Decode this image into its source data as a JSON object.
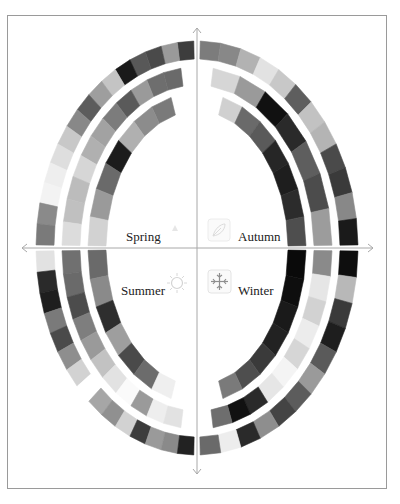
{
  "diagram": {
    "type": "seasonal-color-wheel",
    "center": {
      "x": 197,
      "y": 248
    },
    "axes": {
      "horizontal": {
        "x1": 22,
        "x2": 373,
        "y": 248,
        "arrows": "both"
      },
      "vertical": {
        "x": 197,
        "y1": 28,
        "y2": 474,
        "arrows": "both"
      }
    },
    "quadrants": [
      {
        "id": "spring",
        "label": "Spring",
        "icon": "flower-icon",
        "position": "top-left"
      },
      {
        "id": "autumn",
        "label": "Autumn",
        "icon": "leaf-icon",
        "position": "top-right"
      },
      {
        "id": "summer",
        "label": "Summer",
        "icon": "sun-icon",
        "position": "bottom-left"
      },
      {
        "id": "winter",
        "label": "Winter",
        "icon": "snowflake-icon",
        "position": "bottom-right"
      }
    ],
    "rings": [
      {
        "name": "outer",
        "rx": 152,
        "ry": 198,
        "width": 18
      },
      {
        "name": "middle",
        "rx": 126,
        "ry": 172,
        "width": 18
      },
      {
        "name": "inner",
        "rx": 100,
        "ry": 146,
        "width": 18
      }
    ],
    "swatches": {
      "spring": {
        "outer": [
          "#3d3d3d",
          "#9a9a9a",
          "#4a4a4a",
          "#585858",
          "#1a1a1a",
          "#c4c4c4",
          "#9e9e9e",
          "#5c5c5c",
          "#888888",
          "#c8c8c8",
          "#dedede",
          "#eeeeee",
          "#f3f3f3",
          "#8a8a8a",
          "#7a7a7a"
        ],
        "middle": [
          "#6a6a6a",
          "#6e6e6e",
          "#9a9a9a",
          "#5a5a5a",
          "#7c7c7c",
          "#a2a2a2",
          "#b0b0b0",
          "#d6d6d6",
          "#bcbcbc",
          "#c0c0c0",
          "#dcdcdc"
        ],
        "inner": [
          "#7a7a7a",
          "#8c8c8c",
          "#b0b0b0",
          "#1c1c1c",
          "#6a6a6a",
          "#9a9a9a",
          "#d2d2d2"
        ]
      },
      "autumn": {
        "outer": [
          "#7c7c7c",
          "#888888",
          "#b2b2b2",
          "#e2e2e2",
          "#c8c8c8",
          "#5e5e5e",
          "#c2c2c2",
          "#b4b4b4",
          "#4a4a4a",
          "#3a3a3a",
          "#888888",
          "#1a1a1a"
        ],
        "middle": [
          "#d6d6d6",
          "#9a9a9a",
          "#111111",
          "#2a2a2a",
          "#5e5e5e",
          "#4c4c4c",
          "#9c9c9c"
        ],
        "inner": [
          "#d0d0d0",
          "#6a6a6a",
          "#5a5a5a",
          "#262626",
          "#1e1e1e",
          "#2c2c2c",
          "#4e4e4e"
        ]
      },
      "summer": {
        "outer": [
          "#e2e2e2",
          "#2a2a2a",
          "#1e1e1e",
          "#7a7a7a",
          "#4a4a4a",
          "#8e8e8e",
          "#d2d2d2",
          "#ffffff",
          "#a6a6a6",
          "#909090",
          "#d2d2d2",
          "#3c3c3c",
          "#9a9a9a",
          "#8a8a8a",
          "#222222"
        ],
        "middle": [
          "#707070",
          "#6a6a6a",
          "#4c4c4c",
          "#7e7e7e",
          "#9a9a9a",
          "#c2c2c2",
          "#e2e2e2",
          "#fafafa",
          "#9a9a9a",
          "#eeeeee",
          "#e2e2e2"
        ],
        "inner": [
          "#6a6a6a",
          "#8a8a8a",
          "#2e2e2e",
          "#9e9e9e",
          "#4a4a4a",
          "#6c6c6c",
          "#efefef"
        ]
      },
      "winter": {
        "outer": [
          "#0e0e0e",
          "#b8b8b8",
          "#3a3a3a",
          "#1e1e1e",
          "#5a5a5a",
          "#9a9a9a",
          "#5c5c5c",
          "#444444",
          "#8e8e8e",
          "#2a2a2a",
          "#ededed",
          "#6a6a6a"
        ],
        "middle": [
          "#8a8a8a",
          "#e6e6e6",
          "#d2d2d2",
          "#ececec",
          "#d6d6d6",
          "#f4f4f4",
          "#e6e6e6",
          "#2a2a2a",
          "#111111",
          "#6e6e6e"
        ],
        "inner": [
          "#0a0a0a",
          "#0e0e0e",
          "#1a1a1a",
          "#222222",
          "#3a3a3a",
          "#4e4e4e",
          "#7a7a7a"
        ]
      }
    },
    "colors": {
      "frame": "#9a9a9a",
      "axis": "#a8a8a8",
      "label": "#222222",
      "icon": "#b8b8b8"
    }
  }
}
